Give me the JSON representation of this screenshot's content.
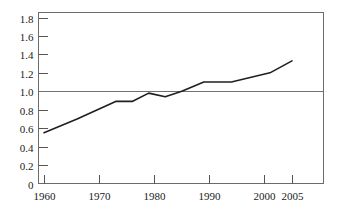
{
  "chart_data": {
    "type": "line",
    "title": "",
    "subtitle": "",
    "xlabel": "",
    "ylabel": "",
    "xlim": [
      1958,
      2009
    ],
    "ylim": [
      0,
      1.9
    ],
    "grid": false,
    "legend": null,
    "reference_line": {
      "axis": "y",
      "value": 1.0,
      "label": "1.0"
    },
    "y_ticks": [
      0,
      0.2,
      0.4,
      0.6,
      0.8,
      1.0,
      1.2,
      1.4,
      1.6,
      1.8
    ],
    "y_tick_labels": [
      "0",
      "0.2",
      "0.4",
      "0.6",
      "0.8",
      "1.0",
      "1.2",
      "1.4",
      "1.6",
      "1.8"
    ],
    "x_ticks": [
      1960,
      1970,
      1980,
      1990,
      2000,
      2005
    ],
    "x_tick_labels": [
      "1960",
      "1970",
      "1980",
      "1990",
      "2000",
      "2005"
    ],
    "series": [
      {
        "name": "value",
        "color": "#1f1f1f",
        "x": [
          1960,
          1966,
          1973,
          1976,
          1979,
          1982,
          1985,
          1989,
          1994,
          2001,
          2005
        ],
        "values": [
          0.55,
          0.7,
          0.89,
          0.89,
          0.98,
          0.94,
          1.0,
          1.1,
          1.1,
          1.2,
          1.33
        ]
      }
    ]
  },
  "axes": {
    "frame_color": "#6b6b6b",
    "tick_color": "#555555",
    "text_color": "#1a1a1a",
    "reference_line_color": "#707070"
  }
}
